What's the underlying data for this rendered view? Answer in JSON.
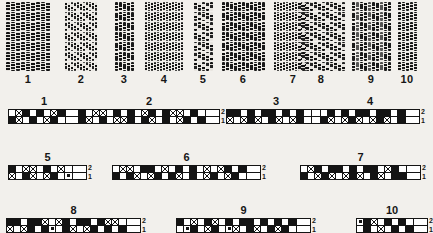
{
  "figure": {
    "background_color": "#f2f0ec",
    "ink_color": "#141414",
    "row_numbers": {
      "upper": "2",
      "lower": "1"
    }
  },
  "photo_panel": {
    "columns": [
      {
        "label": "1",
        "x": 6,
        "width": 44,
        "lines": 7,
        "bars": 9,
        "variant": "v1",
        "bar": "wide",
        "faint": false
      },
      {
        "label": "2",
        "x": 57,
        "width": 48,
        "lines": 7,
        "bars": 11,
        "variant": "v2",
        "bar": "thin",
        "faint": false
      },
      {
        "label": "3",
        "x": 111,
        "width": 26,
        "lines": 7,
        "bars": 5,
        "variant": "v3",
        "bar": "norm",
        "faint": false
      },
      {
        "label": "4",
        "x": 143,
        "width": 42,
        "lines": 7,
        "bars": 13,
        "variant": "v1",
        "bar": "thin",
        "faint": false
      },
      {
        "label": "5",
        "x": 191,
        "width": 24,
        "lines": 7,
        "bars": 5,
        "variant": "v2",
        "bar": "norm",
        "faint": false
      },
      {
        "label": "6",
        "x": 221,
        "width": 44,
        "lines": 7,
        "bars": 11,
        "variant": "v3",
        "bar": "norm",
        "faint": false
      },
      {
        "label": "7",
        "x": 271,
        "width": 44,
        "lines": 7,
        "bars": 13,
        "variant": "v1",
        "bar": "thin",
        "faint": false
      },
      {
        "label": "8",
        "x": 297,
        "width": 48,
        "lines": 7,
        "bars": 12,
        "variant": "v2",
        "bar": "norm",
        "faint": false
      },
      {
        "label": "9",
        "x": 351,
        "width": 40,
        "lines": 7,
        "bars": 10,
        "variant": "v3",
        "bar": "norm",
        "faint": true
      },
      {
        "label": "10",
        "x": 395,
        "width": 24,
        "lines": 7,
        "bars": 5,
        "variant": "v1",
        "bar": "norm",
        "faint": false
      }
    ]
  },
  "ideogram_panel": {
    "strips": [
      {
        "label": "1",
        "x": 8,
        "y": 96,
        "cell_count": 8,
        "row_top": [
          "w",
          "x",
          "b",
          "w",
          "b",
          "w",
          "x",
          "b"
        ],
        "row_bottom": [
          "b",
          "x",
          "w",
          "b",
          "w",
          "x",
          "b",
          "w"
        ]
      },
      {
        "label": "2",
        "x": 78,
        "y": 96,
        "cell_count": 18,
        "row_top": [
          "b",
          "w",
          "x",
          "x",
          "w",
          "b",
          "w",
          "b",
          "w",
          "x",
          "b",
          "w",
          "b",
          "x",
          "x",
          "w",
          "b",
          "w"
        ],
        "row_bottom": [
          "b",
          "x",
          "w",
          "b",
          "w",
          "x",
          "x",
          "b",
          "w",
          "b",
          "x",
          "w",
          "b",
          "w",
          "x",
          "b",
          "w",
          "b"
        ]
      },
      {
        "label": "3",
        "x": 226,
        "y": 96,
        "cell_count": 12,
        "row_top": [
          "b",
          "b",
          "w",
          "b",
          "w",
          "b",
          "b",
          "w",
          "b",
          "w",
          "b",
          "w"
        ],
        "row_bottom": [
          "x",
          "w",
          "x",
          "b",
          "x",
          "w",
          "b",
          "x",
          "w",
          "x",
          "b",
          "w"
        ]
      },
      {
        "label": "4",
        "x": 320,
        "y": 96,
        "cell_count": 12,
        "row_top": [
          "w",
          "b",
          "w",
          "b",
          "w",
          "b",
          "b",
          "w",
          "b",
          "b",
          "w",
          "b"
        ],
        "row_bottom": [
          "b",
          "x",
          "w",
          "x",
          "b",
          "x",
          "w",
          "x",
          "b",
          "x",
          "w",
          "b"
        ]
      },
      {
        "label": "5",
        "x": 8,
        "y": 152,
        "cell_count": 9,
        "row_top": [
          "b",
          "w",
          "x",
          "x",
          "w",
          "b",
          "w",
          "x",
          "w"
        ],
        "row_bottom": [
          "x",
          "w",
          "b",
          "x",
          "w",
          "x",
          "b",
          "w",
          "d"
        ]
      },
      {
        "label": "6",
        "x": 112,
        "y": 152,
        "cell_count": 19,
        "row_top": [
          "w",
          "x",
          "x",
          "w",
          "b",
          "b",
          "w",
          "x",
          "w",
          "b",
          "w",
          "b",
          "w",
          "x",
          "w",
          "x",
          "b",
          "w",
          "b"
        ],
        "row_bottom": [
          "b",
          "w",
          "b",
          "x",
          "w",
          "x",
          "b",
          "w",
          "b",
          "x",
          "w",
          "b",
          "w",
          "x",
          "b",
          "w",
          "x",
          "b",
          "w"
        ]
      },
      {
        "label": "7",
        "x": 300,
        "y": 152,
        "cell_count": 15,
        "row_top": [
          "w",
          "x",
          "b",
          "w",
          "b",
          "b",
          "w",
          "b",
          "w",
          "b",
          "b",
          "w",
          "x",
          "b",
          "w"
        ],
        "row_bottom": [
          "b",
          "w",
          "x",
          "b",
          "x",
          "w",
          "x",
          "b",
          "x",
          "w",
          "b",
          "x",
          "w",
          "b",
          "b"
        ]
      },
      {
        "label": "8",
        "x": 6,
        "y": 205,
        "cell_count": 17,
        "row_top": [
          "b",
          "b",
          "w",
          "b",
          "b",
          "x",
          "w",
          "x",
          "b",
          "w",
          "b",
          "b",
          "w",
          "b",
          "x",
          "x",
          "w"
        ],
        "row_bottom": [
          "x",
          "w",
          "x",
          "b",
          "w",
          "b",
          "d",
          "w",
          "b",
          "x",
          "w",
          "x",
          "b",
          "w",
          "b",
          "w",
          "b"
        ]
      },
      {
        "label": "9",
        "x": 176,
        "y": 205,
        "cell_count": 17,
        "row_top": [
          "b",
          "w",
          "x",
          "w",
          "b",
          "x",
          "w",
          "b",
          "w",
          "b",
          "b",
          "w",
          "b",
          "w",
          "b",
          "w",
          "b"
        ],
        "row_bottom": [
          "w",
          "d",
          "b",
          "w",
          "x",
          "b",
          "w",
          "d",
          "x",
          "w",
          "b",
          "x",
          "w",
          "b",
          "x",
          "b",
          "w"
        ]
      },
      {
        "label": "10",
        "x": 356,
        "y": 205,
        "cell_count": 8,
        "row_top": [
          "d",
          "b",
          "x",
          "w",
          "b",
          "w",
          "b",
          "w"
        ],
        "row_bottom": [
          "w",
          "b",
          "w",
          "x",
          "w",
          "b",
          "w",
          "b"
        ]
      }
    ]
  }
}
